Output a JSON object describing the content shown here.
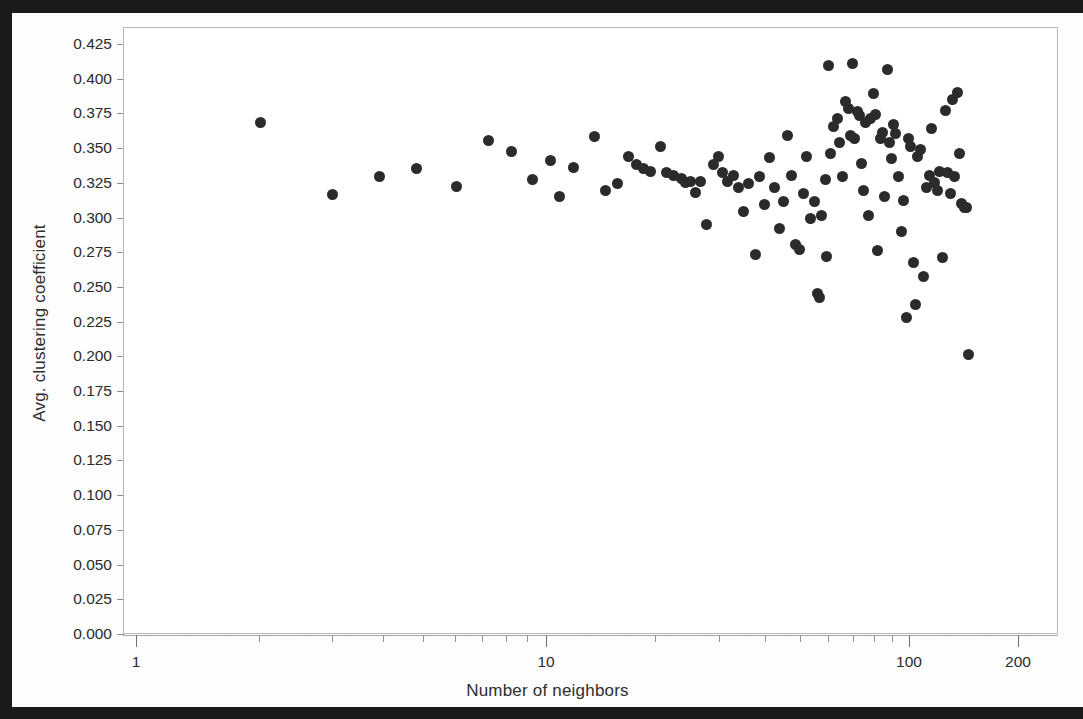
{
  "chart_data": {
    "type": "scatter",
    "title": "",
    "xlabel": "Number of neighbors",
    "ylabel": "Avg. clustering coefficient",
    "xscale": "log",
    "yscale": "linear",
    "xlim": [
      1,
      200
    ],
    "ylim": [
      0.0,
      0.4375
    ],
    "grid": false,
    "legend": null,
    "x_tick_labels": [
      "1",
      "10",
      "100",
      "200"
    ],
    "x_tick_values": [
      1,
      10,
      100,
      200
    ],
    "y_tick_labels": [
      "0.000",
      "0.025",
      "0.050",
      "0.075",
      "0.100",
      "0.125",
      "0.150",
      "0.175",
      "0.200",
      "0.225",
      "0.250",
      "0.275",
      "0.300",
      "0.325",
      "0.350",
      "0.375",
      "0.400",
      "0.425"
    ],
    "y_tick_values": [
      0.0,
      0.025,
      0.05,
      0.075,
      0.1,
      0.125,
      0.15,
      0.175,
      0.2,
      0.225,
      0.25,
      0.275,
      0.3,
      0.325,
      0.35,
      0.375,
      0.4,
      0.425
    ],
    "marker_color": "#2b2b2b",
    "marker_size_px": 11,
    "points": [
      [
        2.0,
        0.369
      ],
      [
        3.0,
        0.317
      ],
      [
        3.9,
        0.33
      ],
      [
        4.8,
        0.336
      ],
      [
        6.0,
        0.323
      ],
      [
        7.2,
        0.356
      ],
      [
        8.2,
        0.348
      ],
      [
        9.2,
        0.328
      ],
      [
        10.2,
        0.342
      ],
      [
        10.8,
        0.316
      ],
      [
        11.8,
        0.337
      ],
      [
        13.5,
        0.359
      ],
      [
        14.5,
        0.32
      ],
      [
        15.6,
        0.325
      ],
      [
        16.8,
        0.345
      ],
      [
        17.6,
        0.339
      ],
      [
        18.5,
        0.336
      ],
      [
        19.3,
        0.334
      ],
      [
        20.5,
        0.352
      ],
      [
        21.4,
        0.333
      ],
      [
        22.3,
        0.331
      ],
      [
        23.4,
        0.329
      ],
      [
        24.0,
        0.326
      ],
      [
        24.8,
        0.327
      ],
      [
        25.6,
        0.319
      ],
      [
        26.5,
        0.327
      ],
      [
        27.5,
        0.296
      ],
      [
        28.8,
        0.339
      ],
      [
        29.6,
        0.345
      ],
      [
        30.5,
        0.333
      ],
      [
        31.5,
        0.327
      ],
      [
        32.6,
        0.331
      ],
      [
        33.8,
        0.322
      ],
      [
        34.8,
        0.305
      ],
      [
        36.0,
        0.325
      ],
      [
        37.5,
        0.274
      ],
      [
        38.6,
        0.33
      ],
      [
        39.8,
        0.31
      ],
      [
        41.0,
        0.344
      ],
      [
        42.3,
        0.322
      ],
      [
        43.6,
        0.293
      ],
      [
        44.8,
        0.312
      ],
      [
        46.0,
        0.36
      ],
      [
        47.2,
        0.331
      ],
      [
        48.4,
        0.281
      ],
      [
        49.5,
        0.278
      ],
      [
        50.8,
        0.318
      ],
      [
        52.0,
        0.345
      ],
      [
        53.3,
        0.3
      ],
      [
        54.6,
        0.312
      ],
      [
        55.6,
        0.246
      ],
      [
        56.3,
        0.243
      ],
      [
        57.2,
        0.302
      ],
      [
        58.4,
        0.328
      ],
      [
        58.9,
        0.273
      ],
      [
        59.8,
        0.41
      ],
      [
        60.5,
        0.347
      ],
      [
        61.5,
        0.366
      ],
      [
        63.0,
        0.372
      ],
      [
        64.0,
        0.355
      ],
      [
        65.2,
        0.33
      ],
      [
        66.5,
        0.384
      ],
      [
        67.5,
        0.379
      ],
      [
        68.4,
        0.36
      ],
      [
        69.3,
        0.412
      ],
      [
        70.5,
        0.358
      ],
      [
        71.5,
        0.377
      ],
      [
        72.5,
        0.374
      ],
      [
        73.5,
        0.34
      ],
      [
        74.5,
        0.32
      ],
      [
        75.6,
        0.369
      ],
      [
        76.8,
        0.302
      ],
      [
        78.0,
        0.372
      ],
      [
        79.2,
        0.39
      ],
      [
        80.5,
        0.375
      ],
      [
        81.6,
        0.277
      ],
      [
        82.8,
        0.358
      ],
      [
        84.0,
        0.362
      ],
      [
        85.2,
        0.316
      ],
      [
        86.5,
        0.407
      ],
      [
        87.6,
        0.355
      ],
      [
        88.8,
        0.343
      ],
      [
        90.0,
        0.368
      ],
      [
        91.5,
        0.361
      ],
      [
        93.0,
        0.33
      ],
      [
        94.5,
        0.291
      ],
      [
        96.0,
        0.313
      ],
      [
        97.5,
        0.229
      ],
      [
        99.0,
        0.358
      ],
      [
        100.5,
        0.352
      ],
      [
        102.0,
        0.268
      ],
      [
        103.5,
        0.238
      ],
      [
        105.0,
        0.345
      ],
      [
        107.0,
        0.35
      ],
      [
        109.0,
        0.258
      ],
      [
        111.0,
        0.322
      ],
      [
        113.0,
        0.331
      ],
      [
        115.0,
        0.365
      ],
      [
        117.0,
        0.326
      ],
      [
        119.0,
        0.32
      ],
      [
        121.0,
        0.334
      ],
      [
        123.0,
        0.272
      ],
      [
        125.0,
        0.378
      ],
      [
        127.0,
        0.333
      ],
      [
        129.0,
        0.318
      ],
      [
        131.0,
        0.386
      ],
      [
        133.0,
        0.33
      ],
      [
        135.0,
        0.391
      ],
      [
        137.0,
        0.347
      ],
      [
        139.0,
        0.311
      ],
      [
        141.0,
        0.308
      ],
      [
        143.0,
        0.308
      ],
      [
        145.0,
        0.202
      ]
    ]
  }
}
